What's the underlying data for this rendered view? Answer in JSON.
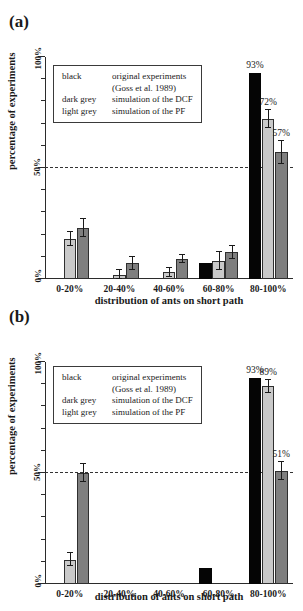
{
  "figure": {
    "ylabel": "percentage of experiments",
    "xlabel": "distribution of ants on short path",
    "ytick_labels": [
      "0%",
      "50%",
      "100%"
    ],
    "categories": [
      "0-20%",
      "20-40%",
      "40-60%",
      "60-80%",
      "80-100%"
    ],
    "legend": {
      "rows": [
        {
          "key": "black",
          "desc": "original experiments"
        },
        {
          "key": "",
          "desc": "(Goss et al. 1989)"
        },
        {
          "key": "dark grey",
          "desc": "simulation of the DCF"
        },
        {
          "key": "light grey",
          "desc": "simulation of the PF"
        }
      ]
    },
    "colors": {
      "black": "#050505",
      "light_grey": "#c9c9c9",
      "dark_grey": "#7f7f7f",
      "axis": "#2b2b2b",
      "refline": "#333333"
    }
  },
  "panel_a": {
    "label": "(a)",
    "value_labels": [
      "93%",
      "72%",
      "57%"
    ]
  },
  "panel_b": {
    "label": "(b)",
    "value_labels": [
      "93%",
      "89%",
      "51%"
    ]
  },
  "chart_data": [
    {
      "type": "bar",
      "panel": "(a)",
      "title": "",
      "xlabel": "distribution of ants on short path",
      "ylabel": "percentage of experiments",
      "ylim": [
        0,
        100
      ],
      "ytick_values": [
        0,
        50,
        100
      ],
      "grid": false,
      "reference_line": 50,
      "legend_position": "upper-left-inset",
      "categories": [
        "0-20%",
        "20-40%",
        "40-60%",
        "60-80%",
        "80-100%"
      ],
      "series": [
        {
          "name": "original experiments (Goss et al. 1989)",
          "color": "#050505",
          "values": [
            0,
            0,
            0,
            7,
            93
          ],
          "errors": [
            0,
            0,
            0,
            0,
            0
          ],
          "data_labels": [
            "",
            "",
            "",
            "",
            "93%"
          ]
        },
        {
          "name": "simulation of the PF",
          "color": "#c9c9c9",
          "values": [
            18,
            2,
            3,
            8,
            72
          ],
          "errors": [
            3,
            2,
            2,
            4,
            4
          ],
          "data_labels": [
            "",
            "",
            "",
            "",
            "72%"
          ]
        },
        {
          "name": "simulation of the DCF",
          "color": "#7f7f7f",
          "values": [
            23,
            7,
            9,
            12,
            57
          ],
          "errors": [
            4,
            3,
            2,
            3,
            5
          ],
          "data_labels": [
            "",
            "",
            "",
            "",
            "57%"
          ]
        }
      ]
    },
    {
      "type": "bar",
      "panel": "(b)",
      "title": "",
      "xlabel": "distribution of ants on short path",
      "ylabel": "percentage of experiments",
      "ylim": [
        0,
        100
      ],
      "ytick_values": [
        0,
        50,
        100
      ],
      "grid": false,
      "reference_line": 50,
      "legend_position": "upper-left-inset",
      "categories": [
        "0-20%",
        "20-40%",
        "40-60%",
        "60-80%",
        "80-100%"
      ],
      "series": [
        {
          "name": "original experiments (Goss et al. 1989)",
          "color": "#050505",
          "values": [
            0,
            0,
            0,
            7,
            93
          ],
          "errors": [
            0,
            0,
            0,
            0,
            0
          ],
          "data_labels": [
            "",
            "",
            "",
            "",
            "93%"
          ]
        },
        {
          "name": "simulation of the PF",
          "color": "#c9c9c9",
          "values": [
            11,
            0,
            0,
            0,
            89
          ],
          "errors": [
            3,
            0,
            0,
            0,
            3
          ],
          "data_labels": [
            "",
            "",
            "",
            "",
            "89%"
          ]
        },
        {
          "name": "simulation of the DCF",
          "color": "#7f7f7f",
          "values": [
            50,
            0,
            0,
            0,
            51
          ],
          "errors": [
            4,
            0,
            0,
            0,
            4
          ],
          "data_labels": [
            "",
            "",
            "",
            "",
            "51%"
          ]
        }
      ]
    }
  ]
}
